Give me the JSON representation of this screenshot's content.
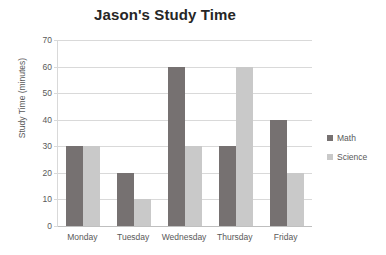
{
  "chart_data": {
    "type": "bar",
    "title": "Jason's Study Time",
    "xlabel": "",
    "ylabel": "Study Time (minutes)",
    "categories": [
      "Monday",
      "Tuesday",
      "Wednesday",
      "Thursday",
      "Friday"
    ],
    "series": [
      {
        "name": "Math",
        "values": [
          30,
          20,
          60,
          30,
          40
        ],
        "color": "#767171"
      },
      {
        "name": "Science",
        "values": [
          30,
          10,
          30,
          60,
          20
        ],
        "color": "#c9c9c9"
      }
    ],
    "ylim": [
      0,
      70
    ],
    "ytick_step": 10,
    "ytick_labels": [
      "0",
      "10",
      "20",
      "30",
      "40",
      "50",
      "60",
      "70"
    ],
    "grid": true,
    "legend_position": "right",
    "background_color": "#ffffff",
    "gridline_color": "#d9d9d9",
    "text_color": "#595959"
  }
}
